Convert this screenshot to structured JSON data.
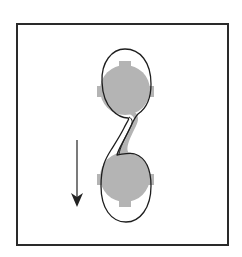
{
  "figure": {
    "width": 242,
    "height": 257,
    "colors": {
      "background": "#ffffff",
      "frame": "#2a2a2a",
      "lobe_fill": "#b4b4b4",
      "outline": "#1e1e1e",
      "arrow": "#222222"
    }
  },
  "frame": {
    "x": 17,
    "y": 24,
    "width": 211,
    "height": 221
  },
  "lobes": [
    {
      "name": "upper-lobe",
      "cx": 125,
      "cy": 90,
      "r": 25,
      "notches": [
        "top",
        "left",
        "right"
      ]
    },
    {
      "name": "lower-lobe",
      "cx": 125,
      "cy": 177,
      "r": 25,
      "notches": [
        "bottom",
        "left",
        "right"
      ]
    }
  ],
  "outline": {
    "description": "Closed S-shaped contour enclosing both lobes joined by a thin twisted neck"
  },
  "arrow": {
    "direction": "down",
    "x": 77,
    "y1": 140,
    "y2": 207,
    "icon": "arrow-down-icon"
  }
}
